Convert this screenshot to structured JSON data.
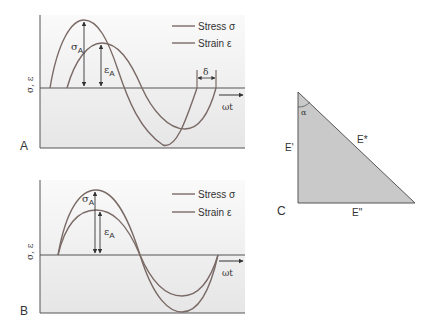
{
  "colors": {
    "curve": "#7a6a66",
    "axis": "#555555",
    "panel_bg_top": "#f7f7f7",
    "panel_bg_bottom": "#e9e9e9",
    "triangle_fill": "#c9c9c9",
    "triangle_stroke": "#555555",
    "text": "#333333"
  },
  "panels": {
    "A": {
      "label": "A",
      "y_axis_label": "σ, ε",
      "x_axis_label": "ωt",
      "legend": {
        "stress": "Stress σ",
        "strain": "Strain ε"
      },
      "amplitude_stress_label": "σ",
      "amplitude_stress_sub": "A",
      "amplitude_strain_label": "ε",
      "amplitude_strain_sub": "A",
      "phase_lag_label": "δ"
    },
    "B": {
      "label": "B",
      "y_axis_label": "σ, ε",
      "x_axis_label": "ωt",
      "legend": {
        "stress": "Stress σ",
        "strain": "Strain ε"
      },
      "amplitude_stress_label": "σ",
      "amplitude_stress_sub": "A",
      "amplitude_strain_label": "ε",
      "amplitude_strain_sub": "A"
    },
    "C": {
      "label": "C",
      "vertical_side": "E'",
      "hypotenuse": "E*",
      "horizontal_side": "E\"",
      "angle": "α"
    }
  }
}
